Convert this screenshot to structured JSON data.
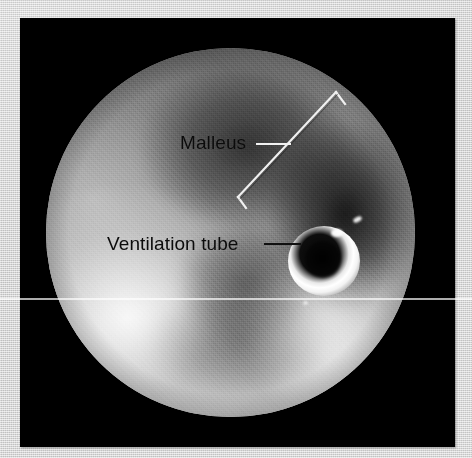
{
  "figure": {
    "kind": "otoscopic-photograph",
    "paper_color": "#d2d2d2",
    "plate_color": "#000000"
  },
  "annotations": [
    {
      "id": "malleus",
      "label": "Malleus",
      "label_color": "#0b0b0b",
      "leader_color": "#f2f2f2",
      "marker": "span-bracket"
    },
    {
      "id": "ventilation-tube",
      "label": "Ventilation tube",
      "label_color": "#0b0b0b",
      "leader_color": "#101010",
      "marker": "pointer-line"
    }
  ],
  "objects": {
    "ventilation_tube": {
      "name": "ventilation-tube",
      "appearance": "bright white ring with dark central lumen",
      "ring_color": "#ffffff",
      "lumen_color": "#000000"
    },
    "endoscope_field": {
      "name": "circular-endoscope-field",
      "shape": "circle"
    }
  },
  "artifacts": {
    "scanline": {
      "name": "horizontal-scanline",
      "color": "#ffffff"
    }
  }
}
